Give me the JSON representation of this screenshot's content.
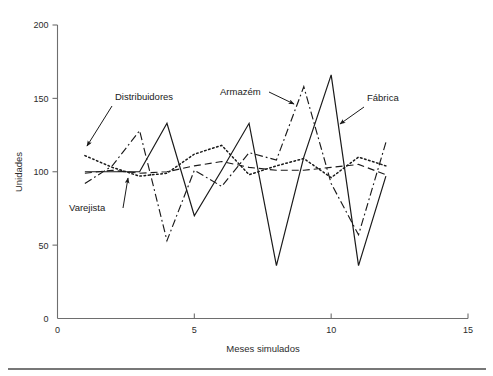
{
  "chart_data": {
    "type": "line",
    "title": "",
    "xlabel": "Meses simulados",
    "ylabel": "Unidades",
    "xlim": [
      0,
      15
    ],
    "ylim": [
      0,
      200
    ],
    "xticks": [
      0,
      5,
      10,
      15
    ],
    "yticks": [
      0,
      50,
      100,
      150,
      200
    ],
    "grid": false,
    "legend_position": "inline-annotations",
    "x": [
      1,
      2,
      3,
      4,
      5,
      6,
      7,
      8,
      9,
      10,
      11,
      12
    ],
    "series": [
      {
        "name": "Fábrica",
        "style": "solid",
        "values": [
          100,
          100,
          100,
          133,
          70,
          101,
          133,
          36,
          110,
          166,
          36,
          97
        ]
      },
      {
        "name": "Armazém",
        "style": "dash-dot",
        "values": [
          92,
          104,
          128,
          53,
          101,
          90,
          113,
          108,
          158,
          92,
          57,
          120
        ]
      },
      {
        "name": "Distribuidores",
        "style": "dashed",
        "values": [
          99,
          101,
          99,
          100,
          104,
          107,
          103,
          101,
          101,
          103,
          105,
          98
        ]
      },
      {
        "name": "Varejista",
        "style": "dotted",
        "values": [
          111,
          103,
          97,
          99,
          112,
          118,
          98,
          104,
          109,
          96,
          110,
          104
        ]
      }
    ],
    "annotations": [
      {
        "label": "Distribuidores",
        "text_x": 115,
        "text_y": 100,
        "arrow_from_x": 112,
        "arrow_from_y": 106,
        "arrow_to_x": 87,
        "arrow_to_y": 146
      },
      {
        "label": "Varejista",
        "text_x": 69,
        "text_y": 211,
        "arrow_from_x": 123,
        "arrow_from_y": 208,
        "arrow_to_x": 128,
        "arrow_to_y": 178
      },
      {
        "label": "Armazém",
        "text_x": 220,
        "text_y": 95,
        "arrow_from_x": 269,
        "arrow_from_y": 92,
        "arrow_to_x": 294,
        "arrow_to_y": 104
      },
      {
        "label": "Fábrica",
        "text_x": 367,
        "text_y": 101,
        "arrow_from_x": 364,
        "arrow_from_y": 107,
        "arrow_to_x": 340,
        "arrow_to_y": 124
      }
    ]
  }
}
